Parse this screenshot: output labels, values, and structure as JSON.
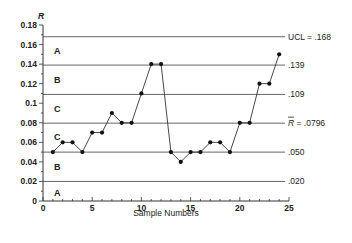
{
  "chart_data": {
    "type": "line",
    "title": "",
    "xlabel": "Sample Numbers",
    "ylabel": "R",
    "xlim": [
      0,
      25
    ],
    "ylim": [
      0,
      0.18
    ],
    "x_ticks": [
      "0",
      "5",
      "10",
      "15",
      "20",
      "25"
    ],
    "y_ticks": [
      "0",
      "0.02",
      "0.04",
      "0.06",
      "0.08",
      "0.1",
      "0.12",
      "0.14",
      "0.16",
      "0.18"
    ],
    "grid": false,
    "x": [
      1,
      2,
      3,
      4,
      5,
      6,
      7,
      8,
      9,
      10,
      11,
      12,
      13,
      14,
      15,
      16,
      17,
      18,
      19,
      20,
      21,
      22,
      23,
      24
    ],
    "series": [
      {
        "name": "R",
        "values": [
          0.05,
          0.06,
          0.06,
          0.05,
          0.07,
          0.07,
          0.09,
          0.08,
          0.08,
          0.11,
          0.14,
          0.14,
          0.05,
          0.04,
          0.05,
          0.05,
          0.06,
          0.06,
          0.05,
          0.08,
          0.08,
          0.12,
          0.12,
          0.15
        ]
      }
    ],
    "control_lines": [
      {
        "value": 0.168,
        "label": "UCL = .168"
      },
      {
        "value": 0.139,
        "label": ".139"
      },
      {
        "value": 0.109,
        "label": ".109"
      },
      {
        "value": 0.0796,
        "label": "R = .0796",
        "bar_over_R": true
      },
      {
        "value": 0.05,
        "label": ".050"
      },
      {
        "value": 0.02,
        "label": ".020"
      }
    ],
    "zones": [
      {
        "label": "A",
        "y": 0.153
      },
      {
        "label": "B",
        "y": 0.124
      },
      {
        "label": "C",
        "y": 0.094
      },
      {
        "label": "C",
        "y": 0.065
      },
      {
        "label": "B",
        "y": 0.035
      },
      {
        "label": "A",
        "y": 0.008
      }
    ]
  }
}
